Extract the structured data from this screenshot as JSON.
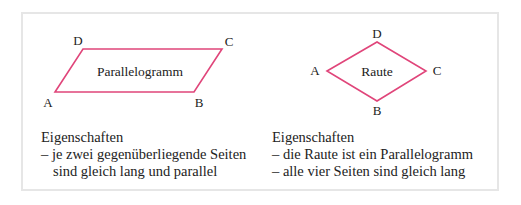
{
  "colors": {
    "shape_stroke": "#e0457a",
    "frame_border": "#e6e6e6",
    "text": "#222222"
  },
  "parallelogram": {
    "title": "Parallelogramm",
    "vertices": {
      "A": "A",
      "B": "B",
      "C": "C",
      "D": "D"
    },
    "properties_heading": "Eigenschaften",
    "properties": [
      "– je zwei gegenüberliegende Seiten",
      "sind gleich lang und parallel"
    ]
  },
  "rhombus": {
    "title": "Raute",
    "vertices": {
      "A": "A",
      "B": "B",
      "C": "C",
      "D": "D"
    },
    "properties_heading": "Eigenschaften",
    "properties": [
      "– die Raute ist ein Parallelogramm",
      "– alle vier Seiten sind gleich lang"
    ]
  }
}
